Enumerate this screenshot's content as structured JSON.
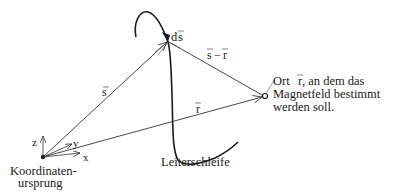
{
  "diagram": {
    "type": "vector-diagram",
    "topic": "Biot-Savart geometry",
    "colors": {
      "line": "#333333",
      "text": "#1a1a1a",
      "background": "#ffffff"
    },
    "labels": {
      "ds": "ds⃗",
      "ds_text": "d",
      "ds_vec": "s",
      "s": "s",
      "s_minus_r_s": "s",
      "s_minus_r_op": "−",
      "s_minus_r_r": "r",
      "r": "r",
      "axis_z": "z",
      "axis_y": "y",
      "axis_x": "x",
      "origin_line1": "Koordinaten-",
      "origin_line2": "ursprung",
      "loop": "Leiterschleife",
      "point_line1": "Ort",
      "point_line1_vec": "r",
      "point_line1_rest": ", an dem das",
      "point_line2": "Magnetfeld bestimmt",
      "point_line3": "werden soll."
    },
    "nodes": [
      {
        "id": "origin",
        "x": 43,
        "y": 157
      },
      {
        "id": "ds-tip",
        "x": 168,
        "y": 40
      },
      {
        "id": "point-r",
        "x": 265,
        "y": 96
      }
    ],
    "edges": [
      {
        "from": "origin",
        "to": "ds-tip",
        "label": "s"
      },
      {
        "from": "ds-tip",
        "to": "point-r",
        "label": "s − r"
      },
      {
        "from": "origin",
        "to": "point-r",
        "label": "r"
      }
    ]
  }
}
